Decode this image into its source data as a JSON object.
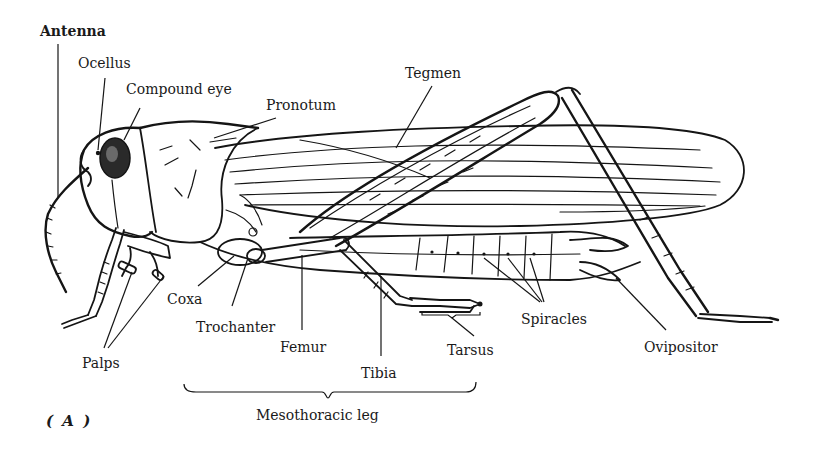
{
  "figure": {
    "panel_label": "( A )",
    "ink_color": "#151515",
    "background_color": "#ffffff"
  },
  "labels": {
    "antenna": "Antenna",
    "ocellus": "Ocellus",
    "compound_eye": "Compound eye",
    "pronotum": "Pronotum",
    "tegmen": "Tegmen",
    "coxa": "Coxa",
    "trochanter": "Trochanter",
    "femur": "Femur",
    "tibia": "Tibia",
    "tarsus": "Tarsus",
    "spiracles": "Spiracles",
    "ovipositor": "Ovipositor",
    "palps": "Palps",
    "mesothoracic_leg": "Mesothoracic leg"
  }
}
